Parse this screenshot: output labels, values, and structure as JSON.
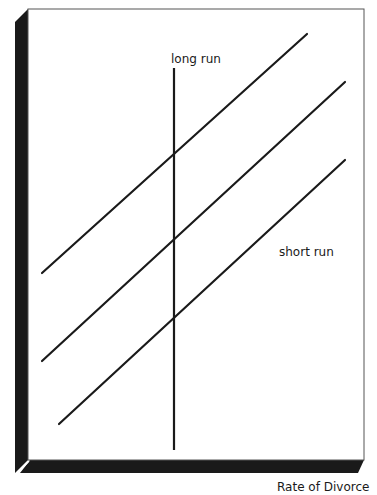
{
  "diagram": {
    "labels": {
      "long_run": "long run",
      "short_run": "short run",
      "x_axis": "Rate of Divorce"
    },
    "colors": {
      "frame_shadow": "#1a1a1a",
      "line": "#1a1a1a",
      "background": "#ffffff",
      "frame_border": "#555555"
    },
    "long_run_curve": {
      "x": 174,
      "y1": 68,
      "y2": 450
    },
    "short_run_curves": [
      {
        "x1": 42,
        "y1": 273,
        "x2": 307,
        "y2": 34
      },
      {
        "x1": 42,
        "y1": 361,
        "x2": 345,
        "y2": 82
      },
      {
        "x1": 59,
        "y1": 424,
        "x2": 345,
        "y2": 160
      }
    ]
  }
}
